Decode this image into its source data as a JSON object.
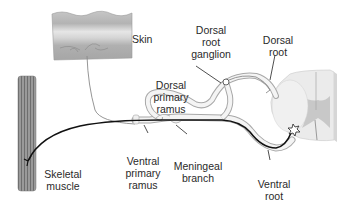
{
  "labels": {
    "skin": "Skin",
    "dorsal_root_ganglion": [
      "Dorsal",
      "root",
      "ganglion"
    ],
    "dorsal_root": [
      "Dorsal",
      "root"
    ],
    "dorsal_primary_ramus": [
      "Dorsal",
      "primary",
      "ramus"
    ],
    "skeletal_muscle": [
      "Skeletal",
      "muscle"
    ],
    "ventral_primary_ramus": [
      "Ventral",
      "primary",
      "ramus"
    ],
    "meningeal_branch": [
      "Meningeal",
      "branch"
    ],
    "ventral_root": [
      "Ventral",
      "root"
    ]
  },
  "colors": {
    "nerve_outline": "#9a9a9a",
    "nerve_fill": "#f2f2f2",
    "motor_axon": "#111111",
    "sensory_axon": "#888888",
    "skin_top": "#b8b8b8",
    "skin_mid": "#dcdcdc",
    "skin_bottom": "#a8a8a8",
    "muscle": "#8c8c8c",
    "spinal_white": "#ececec",
    "spinal_gray": "#c4c4c4",
    "leader_line": "#222222"
  }
}
